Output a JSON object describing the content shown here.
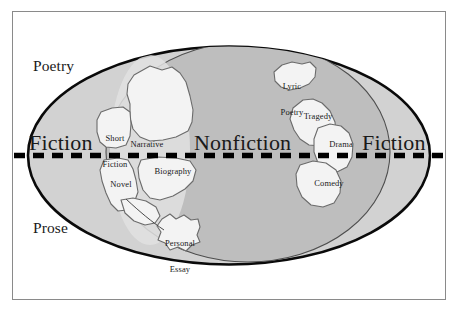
{
  "diagram": {
    "type": "conceptual-map",
    "axis_labels": {
      "top_left": "Poetry",
      "bottom_left": "Prose"
    },
    "major_labels": {
      "left": "Fiction",
      "center": "Nonfiction",
      "right": "Fiction"
    },
    "divider": {
      "style": "dashed",
      "orientation": "horizontal",
      "meaning": "separates Poetry (above) from Prose (below)"
    },
    "regions": [
      {
        "id": "short-fiction",
        "label_line1": "Short",
        "label_line2": "Fiction",
        "side": "left"
      },
      {
        "id": "narrative",
        "label_line1": "Narrative",
        "label_line2": "",
        "side": "left"
      },
      {
        "id": "novel",
        "label_line1": "Novel",
        "label_line2": "",
        "side": "left"
      },
      {
        "id": "biography",
        "label_line1": "Biography",
        "label_line2": "",
        "side": "left"
      },
      {
        "id": "personal-essay",
        "label_line1": "Personal",
        "label_line2": "Essay",
        "side": "left"
      },
      {
        "id": "lyric-poetry",
        "label_line1": "Lyric",
        "label_line2": "Poetry",
        "side": "right"
      },
      {
        "id": "tragedy",
        "label_line1": "Tragedy",
        "label_line2": "",
        "side": "right"
      },
      {
        "id": "drama",
        "label_line1": "Drama",
        "label_line2": "",
        "side": "right"
      },
      {
        "id": "comedy",
        "label_line1": "Comedy",
        "label_line2": "",
        "side": "right"
      }
    ],
    "colors": {
      "page_background": "#ffffff",
      "frame_border": "#8a8a8a",
      "ocean_light": "#d2d2d2",
      "globe_shadow": "#bcbcbc",
      "landmass_fill": "#f2f2f2",
      "landmass_stroke": "#6e6e6e",
      "ellipse_outline": "#000000",
      "divider_color": "#000000",
      "text_color": "#1a1a1a"
    }
  }
}
